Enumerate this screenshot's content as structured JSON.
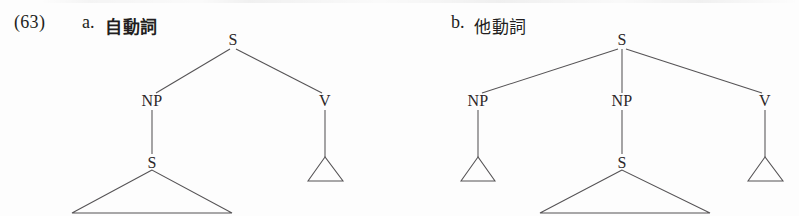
{
  "figure": {
    "example_number": "(63)",
    "domain": "japanese-syntax-trees"
  },
  "items": [
    {
      "id": "a",
      "letter": "a.",
      "gloss": "自動詞",
      "gloss_meaning": "intransitive verb",
      "tree": {
        "root": "S",
        "nodes": [
          {
            "name": "root-s",
            "label": "S",
            "x": 233,
            "y": 40
          },
          {
            "name": "np-left",
            "label": "NP",
            "x": 152,
            "y": 101
          },
          {
            "name": "v-right",
            "label": "V",
            "x": 325,
            "y": 101
          },
          {
            "name": "embedded-s",
            "label": "S",
            "x": 152,
            "y": 163
          }
        ],
        "triangles": [
          {
            "name": "embedded-s-triangle",
            "apex_x": 152,
            "apex_y": 170,
            "left_x": 72,
            "right_x": 232,
            "base_y": 213
          },
          {
            "name": "v-triangle",
            "apex_x": 325,
            "apex_y": 157,
            "left_x": 308,
            "right_x": 343,
            "base_y": 181
          }
        ]
      }
    },
    {
      "id": "b",
      "letter": "b.",
      "gloss": "他動詞",
      "gloss_meaning": "transitive verb",
      "tree": {
        "root": "S",
        "nodes": [
          {
            "name": "root-s",
            "label": "S",
            "x": 622,
            "y": 40
          },
          {
            "name": "np-left",
            "label": "NP",
            "x": 478,
            "y": 101
          },
          {
            "name": "np-middle",
            "label": "NP",
            "x": 622,
            "y": 101
          },
          {
            "name": "v-right",
            "label": "V",
            "x": 765,
            "y": 101
          },
          {
            "name": "embedded-s",
            "label": "S",
            "x": 622,
            "y": 163
          }
        ],
        "triangles": [
          {
            "name": "np-left-triangle",
            "apex_x": 478,
            "apex_y": 157,
            "left_x": 461,
            "right_x": 495,
            "base_y": 181
          },
          {
            "name": "embedded-s-triangle",
            "apex_x": 622,
            "apex_y": 170,
            "left_x": 540,
            "right_x": 710,
            "base_y": 213
          },
          {
            "name": "v-triangle",
            "apex_x": 765,
            "apex_y": 157,
            "left_x": 748,
            "right_x": 783,
            "base_y": 181
          }
        ]
      }
    }
  ],
  "colors": {
    "ink": "#231f20",
    "line": "#555355",
    "page": "#fdfdfd"
  }
}
